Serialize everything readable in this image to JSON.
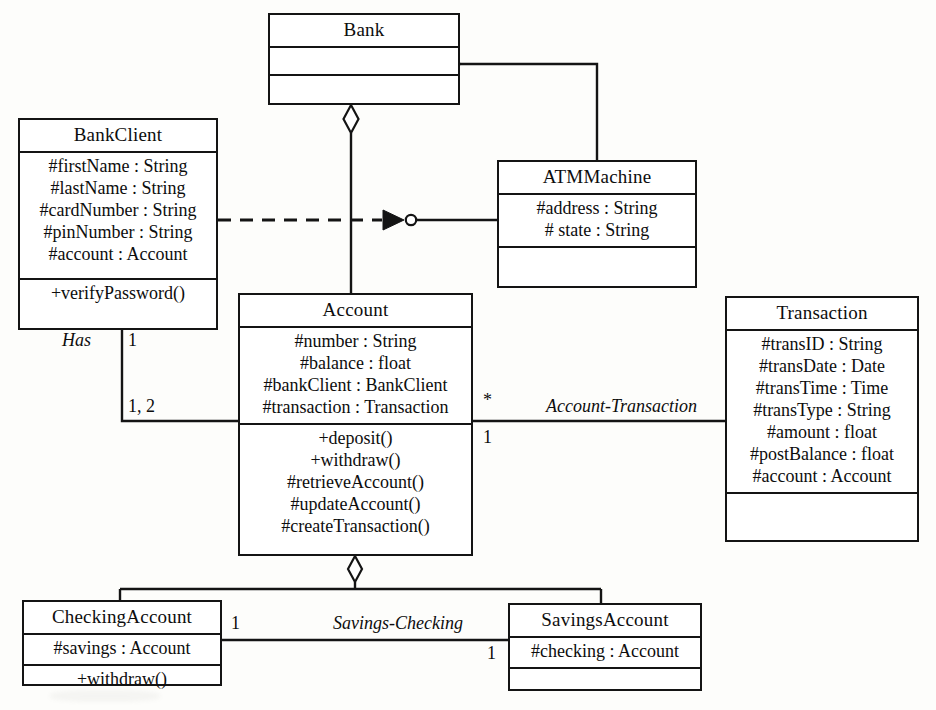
{
  "diagram": {
    "type": "uml-class-diagram",
    "line_color": "#141414",
    "background_color": "#fdfdfb"
  },
  "classes": {
    "bank": {
      "name": "Bank",
      "attributes": [],
      "operations": []
    },
    "bank_client": {
      "name": "BankClient",
      "attributes": [
        "#firstName : String",
        "#lastName : String",
        "#cardNumber : String",
        "#pinNumber : String",
        "#account : Account"
      ],
      "operations": [
        "+verifyPassword()"
      ]
    },
    "atm_machine": {
      "name": "ATMMachine",
      "attributes": [
        "#address : String",
        "# state : String"
      ],
      "operations": []
    },
    "account": {
      "name": "Account",
      "attributes": [
        "#number : String",
        "#balance : float",
        "#bankClient : BankClient",
        "#transaction : Transaction"
      ],
      "operations": [
        "+deposit()",
        "+withdraw()",
        "#retrieveAccount()",
        "#updateAccount()",
        "#createTransaction()"
      ]
    },
    "transaction": {
      "name": "Transaction",
      "attributes": [
        "#transID : String",
        "#transDate : Date",
        "#transTime : Time",
        "#transType : String",
        "#amount : float",
        "#postBalance : float",
        "#account : Account"
      ],
      "operations": []
    },
    "checking_account": {
      "name": "CheckingAccount",
      "attributes": [
        "#savings : Account"
      ],
      "operations": [
        "+withdraw()"
      ]
    },
    "savings_account": {
      "name": "SavingsAccount",
      "attributes": [
        "#checking : Account"
      ],
      "operations": []
    }
  },
  "relationships": {
    "bank_account": {
      "kind": "aggregation",
      "from": "Bank",
      "to": "Account",
      "label": ""
    },
    "bank_atm": {
      "kind": "aggregation",
      "from": "Bank",
      "to": "ATMMachine",
      "label": ""
    },
    "client_atm": {
      "kind": "dependency-ball-and-socket",
      "from": "BankClient",
      "to": "ATMMachine",
      "label": ""
    },
    "client_account": {
      "kind": "association",
      "from": "BankClient",
      "to": "Account",
      "label": "Has",
      "source_multiplicity": "1",
      "target_multiplicity": "1, 2"
    },
    "account_transaction": {
      "kind": "association",
      "from": "Account",
      "to": "Transaction",
      "label": "Account-Transaction",
      "source_multiplicity": "*",
      "target_multiplicity": "1"
    },
    "account_subtypes": {
      "kind": "aggregation",
      "from": "Account",
      "to": "CheckingAccount, SavingsAccount",
      "label": ""
    },
    "savings_checking": {
      "kind": "association",
      "from": "CheckingAccount",
      "to": "SavingsAccount",
      "label": "Savings-Checking",
      "source_multiplicity": "1",
      "target_multiplicity": "1"
    }
  }
}
